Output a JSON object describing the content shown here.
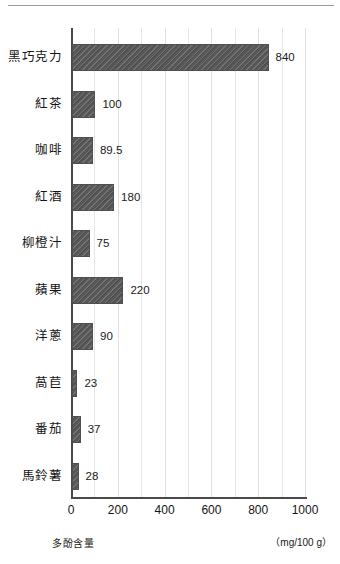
{
  "chart_data": {
    "type": "bar",
    "orientation": "horizontal",
    "title": "",
    "subtitle": "",
    "xlabel": "多酚含量",
    "ylabel": "",
    "unit_note": "（mg/100 g）",
    "xlim": [
      0,
      1000
    ],
    "x_ticks": [
      0,
      200,
      400,
      600,
      800,
      1000
    ],
    "x_tick_labels": [
      "0",
      "200",
      "400",
      "600",
      "800",
      "1000"
    ],
    "gridlines": true,
    "gridline_step": 100,
    "legend": null,
    "categories": [
      "黑巧克力",
      "紅茶",
      "咖啡",
      "紅酒",
      "柳橙汁",
      "蘋果",
      "洋蔥",
      "萵苣",
      "番茄",
      "馬鈴薯"
    ],
    "values": [
      840,
      100,
      89.5,
      180,
      75,
      220,
      90,
      23,
      37,
      28
    ],
    "data_labels": [
      "840",
      "100",
      "89.5",
      "180",
      "75",
      "220",
      "90",
      "23",
      "37",
      "28"
    ],
    "bar_color": "#585858",
    "bar_pattern": "diagonal-hatch",
    "axis_color": "#4a4a4a",
    "grid_color": "#e6e6e6",
    "text_color": "#141414"
  },
  "bars": [
    {
      "label": "黑巧克力",
      "value": 840,
      "data_label": "840"
    },
    {
      "label": "紅茶",
      "value": 100,
      "data_label": "100"
    },
    {
      "label": "咖啡",
      "value": 89.5,
      "data_label": "89.5"
    },
    {
      "label": "紅酒",
      "value": 180,
      "data_label": "180"
    },
    {
      "label": "柳橙汁",
      "value": 75,
      "data_label": "75"
    },
    {
      "label": "蘋果",
      "value": 220,
      "data_label": "220"
    },
    {
      "label": "洋蔥",
      "value": 90,
      "data_label": "90"
    },
    {
      "label": "萵苣",
      "value": 23,
      "data_label": "23"
    },
    {
      "label": "番茄",
      "value": 37,
      "data_label": "37"
    },
    {
      "label": "馬鈴薯",
      "value": 28,
      "data_label": "28"
    }
  ]
}
